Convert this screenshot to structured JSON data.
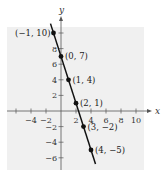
{
  "chart_data": {
    "type": "line",
    "title": "",
    "xlabel": "x",
    "ylabel": "y",
    "xlim": [
      -6,
      11
    ],
    "ylim": [
      -7,
      12
    ],
    "grid": false,
    "background": "#f0f0f0",
    "x_ticks": [
      -6,
      -4,
      -2,
      0,
      2,
      4,
      6,
      8,
      10
    ],
    "x_tick_labels": [
      "-4",
      "-2",
      "2",
      "4",
      "6",
      "8",
      "10"
    ],
    "x_tick_label_values": [
      -4,
      -2,
      2,
      4,
      6,
      8,
      10
    ],
    "y_ticks": [
      -6,
      -4,
      -2,
      2,
      4,
      6,
      8,
      10
    ],
    "y_tick_labels": [
      "8",
      "6",
      "4",
      "2",
      "-2",
      "-4",
      "-6"
    ],
    "y_tick_label_values": [
      8,
      6,
      4,
      2,
      -2,
      -4,
      -6
    ],
    "series": [
      {
        "name": "y = -3x + 7",
        "line": {
          "x_start": -1.4,
          "x_end": 4.6
        },
        "points": [
          {
            "x": -1,
            "y": 10,
            "label": "(−1, 10)"
          },
          {
            "x": 0,
            "y": 7,
            "label": "(0, 7)"
          },
          {
            "x": 1,
            "y": 4,
            "label": "(1, 4)"
          },
          {
            "x": 2,
            "y": 1,
            "label": "(2, 1)"
          },
          {
            "x": 3,
            "y": -2,
            "label": "(3, −2)"
          },
          {
            "x": 4,
            "y": -5,
            "label": "(4, −5)"
          }
        ]
      }
    ]
  }
}
